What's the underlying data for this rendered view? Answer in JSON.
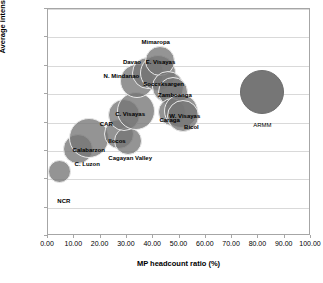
{
  "chart_data": {
    "type": "scatter",
    "title": "",
    "subtitle": "",
    "xlabel": "MP headcount ratio (%)",
    "ylabel": "Average intensity of MP (A)",
    "xlim": [
      0.0,
      100.0
    ],
    "ylim": [
      0.25,
      0.65
    ],
    "xticks": [
      "0.00",
      "10.00",
      "20.00",
      "30.00",
      "40.00",
      "50.00",
      "60.00",
      "70.00",
      "80.00",
      "90.00",
      "100.00"
    ],
    "yticks": [
      "0.25",
      "0.30",
      "0.35",
      "0.40",
      "0.45",
      "0.50",
      "0.55",
      "0.60",
      "0.65"
    ],
    "grid": "horizontal",
    "legend": "none",
    "marker_style": "bubble",
    "note": "Bubble size encodes population/poor-population magnitude",
    "points": [
      {
        "label": "NCR",
        "x": 4.5,
        "y": 0.363,
        "size": 23,
        "style": "ring",
        "label_dx": 4,
        "label_dy": 26
      },
      {
        "label": "C. Luzon",
        "x": 11.5,
        "y": 0.403,
        "size": 30,
        "style": "ring",
        "label_dx": 9,
        "label_dy": 12
      },
      {
        "label": "Calabarzon",
        "x": 15.5,
        "y": 0.423,
        "size": 40,
        "style": "ring",
        "label_dx": 0,
        "label_dy": 9
      },
      {
        "label": "Ilocos",
        "x": 27.0,
        "y": 0.43,
        "size": 30,
        "style": "ring",
        "label_dx": -2,
        "label_dy": 4
      },
      {
        "label": "Cagayan Valley",
        "x": 30.5,
        "y": 0.417,
        "size": 28,
        "style": "ring",
        "label_dx": 2,
        "label_dy": 14
      },
      {
        "label": "CAR",
        "x": 29.0,
        "y": 0.463,
        "size": 32,
        "style": "ring",
        "label_dx": -18,
        "label_dy": 6
      },
      {
        "label": "C. Visayas",
        "x": 33.5,
        "y": 0.47,
        "size": 38,
        "style": "ring",
        "label_dx": -6,
        "label_dy": 0
      },
      {
        "label": "N. Mindanao",
        "x": 34.0,
        "y": 0.523,
        "size": 34,
        "style": "ring",
        "label_dx": -16,
        "label_dy": -8
      },
      {
        "label": "Davao",
        "x": 38.0,
        "y": 0.538,
        "size": 32,
        "style": "ring",
        "label_dx": -16,
        "label_dy": -14
      },
      {
        "label": "E. Visayas",
        "x": 42.0,
        "y": 0.538,
        "size": 36,
        "style": "ring",
        "label_dx": 2,
        "label_dy": -14
      },
      {
        "label": "Mimaropa",
        "x": 42.5,
        "y": 0.558,
        "size": 30,
        "style": "ring",
        "label_dx": -4,
        "label_dy": -22
      },
      {
        "label": "Soccsksargen",
        "x": 45.5,
        "y": 0.513,
        "size": 32,
        "style": "ring",
        "label_dx": -4,
        "label_dy": -6
      },
      {
        "label": "Zamboanga",
        "x": 47.5,
        "y": 0.503,
        "size": 30,
        "style": "ring",
        "label_dx": 2,
        "label_dy": 0
      },
      {
        "label": "Caraga",
        "x": 47.0,
        "y": 0.468,
        "size": 28,
        "style": "ring",
        "label_dx": -2,
        "label_dy": 5
      },
      {
        "label": "W. Visayas",
        "x": 50.5,
        "y": 0.47,
        "size": 34,
        "style": "ring",
        "label_dx": 4,
        "label_dy": 2
      },
      {
        "label": "Bicol",
        "x": 51.5,
        "y": 0.462,
        "size": 32,
        "style": "ring",
        "label_dx": 8,
        "label_dy": 8
      },
      {
        "label": "ARMM",
        "x": 81.5,
        "y": 0.503,
        "size": 44,
        "style": "solid",
        "label_dx": 0,
        "label_dy": 30
      }
    ]
  }
}
